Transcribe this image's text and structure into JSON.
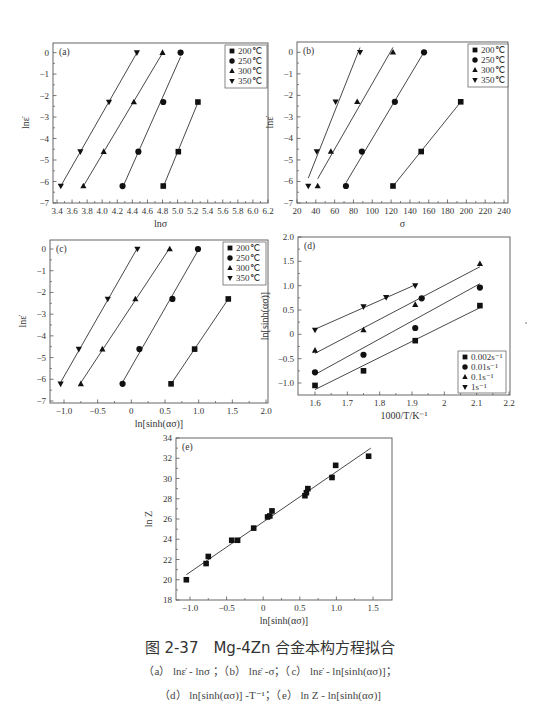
{
  "figure": {
    "caption_title": "图 2-37　Mg-4Zn 合金本构方程拟合",
    "caption_line1": "（a） lnε̇ - lnσ ；（b） lnε̇ -σ；（c） lnε̇ - ln[sinh(ασ)]；",
    "caption_line2": "（d） ln[sinh(ασ)] -T⁻¹；（e） ln Z - ln[sinh(ασ)]"
  },
  "chart_data": [
    {
      "id": "a",
      "type": "scatter",
      "panel_label": "(a)",
      "xlabel": "lnσ",
      "ylabel": "lnε̇",
      "xlim": [
        3.4,
        6.2
      ],
      "ylim": [
        -7,
        0.4
      ],
      "xticks": [
        3.4,
        3.6,
        3.8,
        4.0,
        4.2,
        4.4,
        4.6,
        4.8,
        5.0,
        5.2,
        5.4,
        5.6,
        5.8,
        6.0,
        6.2
      ],
      "yticks": [
        0,
        -1,
        -2,
        -3,
        -4,
        -5,
        -6,
        -7
      ],
      "legend_position": "upper right",
      "fit_lines": true,
      "series": [
        {
          "name": "200℃",
          "marker": "square",
          "x": [
            4.81,
            5.01,
            5.27
          ],
          "y": [
            -6.21,
            -4.61,
            -2.3
          ]
        },
        {
          "name": "250℃",
          "marker": "circle",
          "x": [
            4.27,
            4.48,
            4.81,
            5.04
          ],
          "y": [
            -6.21,
            -4.61,
            -2.3,
            0
          ]
        },
        {
          "name": "300℃",
          "marker": "triangle-up",
          "x": [
            3.75,
            4.02,
            4.42,
            4.8
          ],
          "y": [
            -6.21,
            -4.61,
            -2.3,
            0
          ]
        },
        {
          "name": "350℃",
          "marker": "triangle-down",
          "x": [
            3.45,
            3.71,
            4.09,
            4.46
          ],
          "y": [
            -6.21,
            -4.61,
            -2.3,
            0
          ]
        }
      ]
    },
    {
      "id": "b",
      "type": "scatter",
      "panel_label": "(b)",
      "xlabel": "σ",
      "ylabel": "lnε̇",
      "xlim": [
        20,
        240
      ],
      "ylim": [
        -7,
        0.4
      ],
      "xticks": [
        20,
        40,
        60,
        80,
        100,
        120,
        140,
        160,
        180,
        200,
        220,
        240
      ],
      "yticks": [
        0,
        -1,
        -2,
        -3,
        -4,
        -5,
        -6,
        -7
      ],
      "legend_position": "upper right",
      "fit_lines": true,
      "series": [
        {
          "name": "200℃",
          "marker": "square",
          "x": [
            122,
            152,
            194
          ],
          "y": [
            -6.21,
            -4.61,
            -2.3
          ]
        },
        {
          "name": "250℃",
          "marker": "circle",
          "x": [
            72,
            89,
            124,
            155
          ],
          "y": [
            -6.21,
            -4.61,
            -2.3,
            0
          ]
        },
        {
          "name": "300℃",
          "marker": "triangle-up",
          "x": [
            42,
            56,
            84,
            122
          ],
          "y": [
            -6.21,
            -4.61,
            -2.3,
            0
          ]
        },
        {
          "name": "350℃",
          "marker": "triangle-down",
          "x": [
            32,
            41,
            61,
            87
          ],
          "y": [
            -6.21,
            -4.61,
            -2.3,
            0
          ]
        }
      ]
    },
    {
      "id": "c",
      "type": "scatter",
      "panel_label": "(c)",
      "xlabel": "ln[sinh(ασ)]",
      "ylabel": "lnε̇",
      "xlim": [
        -1.2,
        2.0
      ],
      "ylim": [
        -7,
        0.4
      ],
      "xticks": [
        -1.0,
        -0.5,
        0,
        0.5,
        1.0,
        1.5,
        2.0
      ],
      "xtick_labels": [
        "-1.0",
        "-0.5",
        "0",
        "0.5",
        "1.0",
        "1.5",
        "2.0"
      ],
      "yticks": [
        0,
        -1,
        -2,
        -3,
        -4,
        -5,
        -6,
        -7
      ],
      "legend_position": "upper right",
      "fit_lines": true,
      "series": [
        {
          "name": "200℃",
          "marker": "square",
          "x": [
            0.59,
            0.94,
            1.44
          ],
          "y": [
            -6.21,
            -4.61,
            -2.3
          ]
        },
        {
          "name": "250℃",
          "marker": "circle",
          "x": [
            -0.13,
            0.12,
            0.61,
            0.99
          ],
          "y": [
            -6.21,
            -4.61,
            -2.3,
            0
          ]
        },
        {
          "name": "300℃",
          "marker": "triangle-up",
          "x": [
            -0.75,
            -0.43,
            0.06,
            0.57
          ],
          "y": [
            -6.21,
            -4.61,
            -2.3,
            0
          ]
        },
        {
          "name": "350℃",
          "marker": "triangle-down",
          "x": [
            -1.05,
            -0.78,
            -0.35,
            0.09
          ],
          "y": [
            -6.21,
            -4.61,
            -2.3,
            0
          ]
        }
      ]
    },
    {
      "id": "d",
      "type": "scatter",
      "panel_label": "(d)",
      "xlabel": "1000/T/K⁻¹",
      "ylabel": "ln[sinh(ασ)]",
      "xlim": [
        1.55,
        2.2
      ],
      "ylim": [
        -1.25,
        2.0
      ],
      "xticks": [
        1.6,
        1.7,
        1.8,
        1.9,
        2.0,
        2.1,
        2.2
      ],
      "yticks": [
        2.0,
        1.5,
        1.0,
        0.5,
        0,
        -0.5,
        -1.0
      ],
      "ytick_labels": [
        "2.0",
        "1.5",
        "1.0",
        "0.5",
        "0",
        "-0.5",
        "-1.0"
      ],
      "legend_position": "lower right",
      "fit_lines": true,
      "series": [
        {
          "name": "0.002s⁻¹",
          "marker": "square",
          "x": [
            1.6,
            1.75,
            1.91,
            2.11
          ],
          "y": [
            -1.05,
            -0.75,
            -0.13,
            0.59
          ]
        },
        {
          "name": "0.01s⁻¹",
          "marker": "circle",
          "x": [
            1.6,
            1.75,
            1.91,
            1.93,
            2.11
          ],
          "y": [
            -0.78,
            -0.42,
            0.13,
            0.74,
            0.96
          ]
        },
        {
          "name": "0.1s⁻¹",
          "marker": "triangle-up",
          "x": [
            1.6,
            1.75,
            1.91,
            2.11
          ],
          "y": [
            -0.33,
            0.09,
            0.61,
            1.45
          ]
        },
        {
          "name": "1s⁻¹",
          "marker": "triangle-down",
          "x": [
            1.6,
            1.75,
            1.82,
            1.91
          ],
          "y": [
            0.09,
            0.57,
            0.76,
            1.0
          ]
        }
      ]
    },
    {
      "id": "e",
      "type": "scatter",
      "panel_label": "(e)",
      "xlabel": "ln[sinh(ασ)]",
      "ylabel": "ln Z",
      "xlim": [
        -1.2,
        1.75
      ],
      "ylim": [
        18,
        34
      ],
      "xticks": [
        -1.0,
        -0.5,
        0,
        0.5,
        1.0,
        1.5
      ],
      "xtick_labels": [
        "-1.0",
        "-0.5",
        "0",
        "0.5",
        "1.0",
        "1.5"
      ],
      "yticks": [
        18,
        20,
        22,
        24,
        26,
        28,
        30,
        32,
        34
      ],
      "fit_lines": true,
      "fit": {
        "x": [
          -1.05,
          1.47
        ],
        "y": [
          20.5,
          33.0
        ]
      },
      "series": [
        {
          "name": "data",
          "marker": "square",
          "x": [
            -1.05,
            -0.78,
            -0.75,
            -0.43,
            -0.35,
            -0.13,
            0.06,
            0.09,
            0.12,
            0.57,
            0.59,
            0.61,
            0.94,
            0.99,
            1.44
          ],
          "y": [
            20.0,
            21.6,
            22.3,
            23.9,
            23.9,
            25.1,
            26.2,
            26.3,
            26.8,
            28.3,
            28.6,
            29.0,
            30.1,
            31.3,
            32.2
          ]
        }
      ]
    }
  ]
}
